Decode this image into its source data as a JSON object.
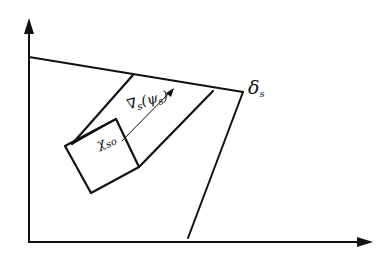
{
  "diagram": {
    "type": "geometric-region-plot",
    "labels": {
      "delta": "δ",
      "delta_sub": "s",
      "nabla": "∇",
      "nabla_sub": "s",
      "psi_expr_open": "(",
      "psi": "ψ",
      "psi_sub": "s",
      "psi_expr_close": ")",
      "chi": "χ",
      "chi_sub": "so"
    },
    "colors": {
      "stroke": "#111111",
      "background": "#ffffff"
    }
  }
}
